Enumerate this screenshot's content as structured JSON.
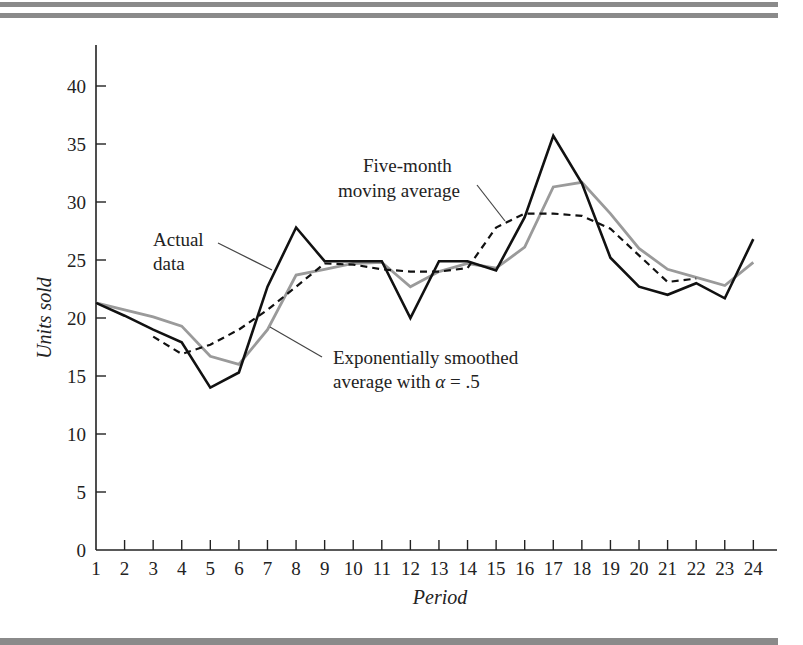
{
  "chart_data": {
    "type": "line",
    "title": "",
    "xlabel": "Period",
    "ylabel": "Units sold",
    "x": [
      1,
      2,
      3,
      4,
      5,
      6,
      7,
      8,
      9,
      10,
      11,
      12,
      13,
      14,
      15,
      16,
      17,
      18,
      19,
      20,
      21,
      22,
      23,
      24
    ],
    "xticks": [
      "1",
      "2",
      "3",
      "4",
      "5",
      "6",
      "7",
      "8",
      "9",
      "10",
      "11",
      "12",
      "13",
      "14",
      "15",
      "16",
      "17",
      "18",
      "19",
      "20",
      "21",
      "22",
      "23",
      "24"
    ],
    "yticks": [
      "0",
      "5",
      "10",
      "15",
      "20",
      "25",
      "30",
      "35",
      "40"
    ],
    "ylim": [
      0,
      43
    ],
    "xlim": [
      1,
      24.8
    ],
    "grid": false,
    "legend": "none (inline annotations)",
    "series": [
      {
        "name": "Actual data",
        "style": "solid-black",
        "color": "#111111",
        "values": [
          21.3,
          20.2,
          19.0,
          17.9,
          14.0,
          15.3,
          22.7,
          27.8,
          24.9,
          24.9,
          24.9,
          20.0,
          24.9,
          24.9,
          24.1,
          28.7,
          35.7,
          31.6,
          25.2,
          22.7,
          22.0,
          23.0,
          21.7,
          26.8
        ]
      },
      {
        "name": "Five-month moving average",
        "style": "dashed-black",
        "color": "#111111",
        "values": [
          null,
          null,
          18.4,
          16.9,
          17.7,
          19.0,
          20.7,
          22.7,
          24.7,
          24.6,
          24.2,
          24.0,
          24.0,
          24.3,
          27.8,
          29.0,
          29.0,
          28.8,
          27.7,
          25.4,
          23.1,
          23.4,
          null,
          null
        ]
      },
      {
        "name": "Exponentially smoothed average with α = .5",
        "style": "solid-grey",
        "color": "#9a9a9a",
        "values": [
          21.3,
          20.7,
          20.1,
          19.3,
          16.7,
          16.0,
          19.0,
          23.7,
          24.2,
          24.7,
          24.8,
          22.7,
          24.0,
          24.7,
          24.3,
          26.1,
          31.3,
          31.7,
          29.0,
          26.0,
          24.2,
          23.5,
          22.8,
          24.8
        ]
      }
    ],
    "annotations": [
      {
        "text": [
          "Actual",
          "data"
        ],
        "target_series": "Actual data"
      },
      {
        "text": [
          "Five-month",
          "moving average"
        ],
        "target_series": "Five-month moving average"
      },
      {
        "text": [
          "Exponentially smoothed",
          "average with α = .5"
        ],
        "target_series": "Exponentially smoothed average with α = .5"
      }
    ]
  },
  "labels": {
    "ylabel": "Units sold",
    "xlabel": "Period",
    "annot_actual_1": "Actual",
    "annot_actual_2": "data",
    "annot_ma_1": "Five-month",
    "annot_ma_2": "moving average",
    "annot_exp_1": "Exponentially smoothed",
    "annot_exp_2": "average with ",
    "annot_exp_alpha": "α",
    "annot_exp_3": " = .5"
  }
}
